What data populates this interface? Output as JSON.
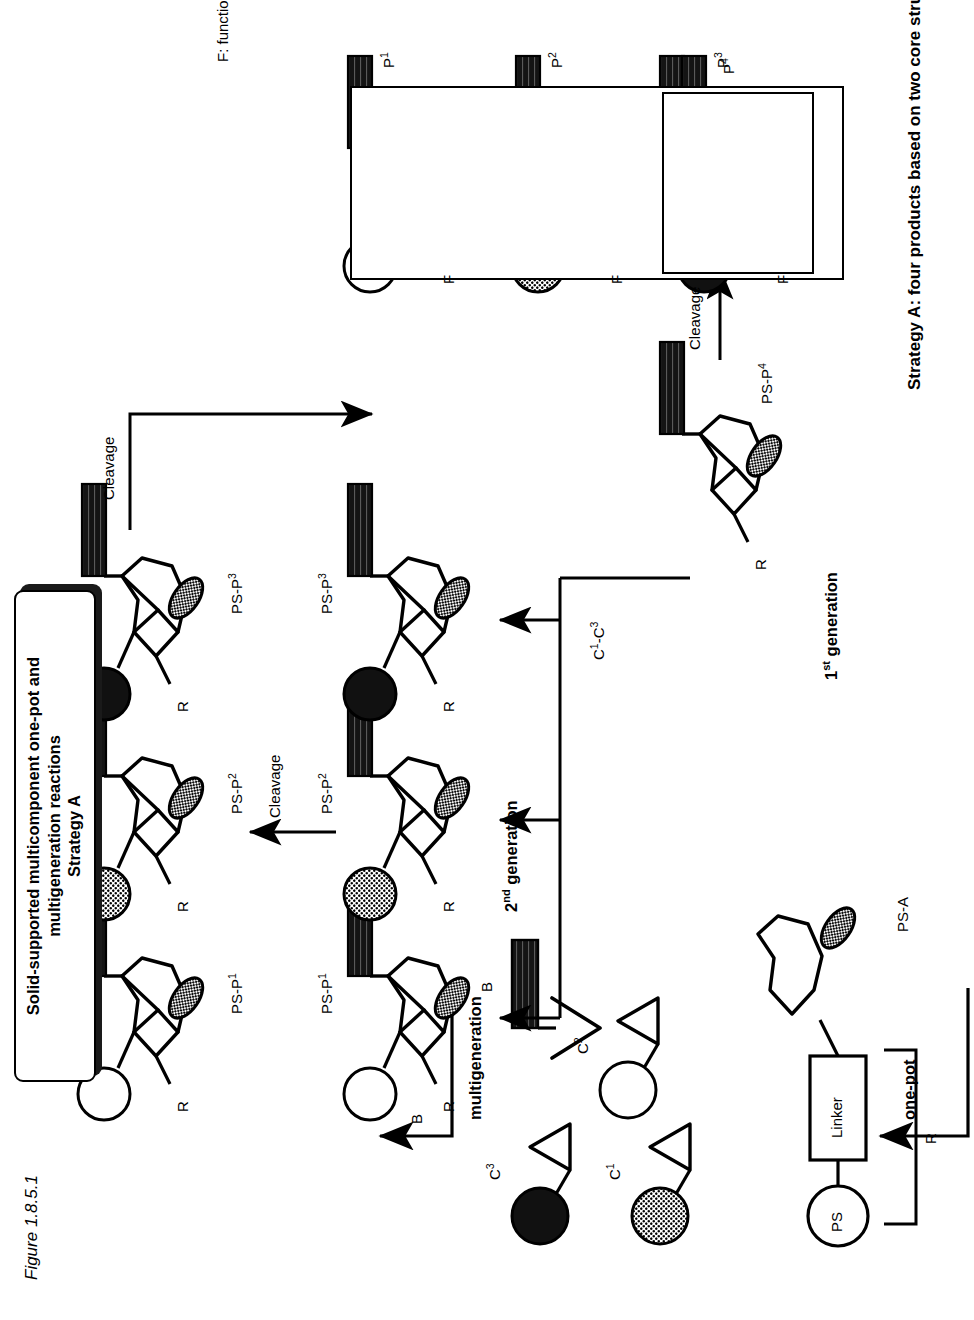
{
  "figure": {
    "caption": "Figure 1.8.5.1",
    "title_line1": "Solid-supported multicomponent one-pot and multigeneration reactions",
    "title_line2": "Strategy A",
    "strategy_caption": "Strategy A: four products based on two core structures",
    "legend_f": "F: functional group"
  },
  "labels": {
    "one_pot": "one-pot",
    "multigeneration": "multigeneration",
    "gen1": "1st generation",
    "gen1_num": "1",
    "gen1_sup": "st",
    "gen1_word": " generation",
    "gen2_num": "2",
    "gen2_sup": "nd",
    "gen2_word": " generation",
    "cleavage": "Cleavage",
    "ps": "PS",
    "linker": "Linker",
    "r_bracket": "R",
    "ps_a": "PS-A",
    "reagent_b": "B",
    "components_range": "C",
    "components_range_sup1": "1",
    "components_range_dash": "-C",
    "components_range_sup2": "3",
    "f_substituent": "F",
    "r_substituent": "R"
  },
  "components": [
    {
      "id": "C1",
      "name": "C",
      "sup": "1",
      "fill": "gray"
    },
    {
      "id": "C2",
      "name": "C",
      "sup": "2",
      "fill": "white"
    },
    {
      "id": "C3",
      "name": "C",
      "sup": "3",
      "fill": "black"
    }
  ],
  "bound_products": [
    {
      "name": "PS-P",
      "sup": "1",
      "ball": "white"
    },
    {
      "name": "PS-P",
      "sup": "2",
      "ball": "gray"
    },
    {
      "name": "PS-P",
      "sup": "3",
      "ball": "black"
    }
  ],
  "bound_products_top": [
    {
      "name": "PS-P",
      "sup": "1",
      "ball": "white"
    },
    {
      "name": "PS-P",
      "sup": "2",
      "ball": "gray"
    },
    {
      "name": "PS-P",
      "sup": "3",
      "ball": "black"
    }
  ],
  "cleaved_products": [
    {
      "name": "P",
      "sup": "1",
      "ball": "white"
    },
    {
      "name": "P",
      "sup": "2",
      "ball": "gray"
    },
    {
      "name": "P",
      "sup": "3",
      "ball": "black"
    }
  ],
  "first_generation": {
    "bound": "PS-P",
    "bound_sup": "4",
    "product": "P",
    "product_sup": "4"
  },
  "colors": {
    "stroke": "#000000",
    "ball_white": "#ffffff",
    "ball_gray": "#8c8c8c",
    "ball_black": "#111111",
    "bar": "#1a1a1a",
    "ellipse": "#9a9a9a",
    "background": "#ffffff"
  },
  "cleavage_arrows": [
    "Cleavage",
    "Cleavage",
    "Cleavage"
  ]
}
